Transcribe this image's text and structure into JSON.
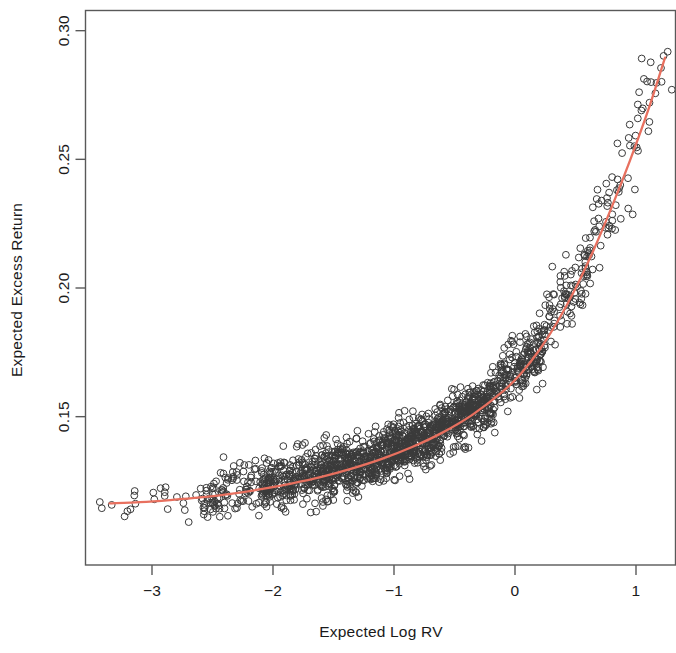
{
  "chart_data": {
    "type": "scatter",
    "title": "",
    "xlabel": "Expected Log RV",
    "ylabel": "Expected Excess Return",
    "xlim": [
      -3.45,
      1.35
    ],
    "ylim": [
      0.1045,
      0.3125
    ],
    "xticks": [
      -3,
      -2,
      -1,
      0,
      1
    ],
    "xtick_labels": [
      "-3",
      "-2",
      "-1",
      "0",
      "1"
    ],
    "yticks": [
      0.15,
      0.2,
      0.25,
      0.3
    ],
    "ytick_labels": [
      "0.15",
      "0.20",
      "0.25",
      "0.30"
    ],
    "grid": false,
    "legend": null,
    "marker": {
      "shape": "open-circle",
      "radius": 3.4,
      "stroke": "#3a3a3a",
      "stroke_width": 1.0,
      "fill": "none"
    },
    "series": [
      {
        "name": "observations",
        "type": "scatter",
        "n_points": 1800,
        "description": "Dense cloud of open circles rising convexly from lower-left to upper-right; heavy concentration between x = -2.4 and x = 0.1 around y = 0.12 to 0.16, thinning and climbing steeply beyond x = 0.2 up to y = 0.30.",
        "density_bands": [
          {
            "x_from": -3.45,
            "x_to": -2.6,
            "y_center": 0.1185,
            "y_spread": 0.0075,
            "weight": 0.012
          },
          {
            "x_from": -2.6,
            "x_to": -2.1,
            "y_center": 0.123,
            "y_spread": 0.0085,
            "weight": 0.055
          },
          {
            "x_from": -2.1,
            "x_to": -1.6,
            "y_center": 0.1285,
            "y_spread": 0.0085,
            "weight": 0.135
          },
          {
            "x_from": -1.6,
            "x_to": -1.1,
            "y_center": 0.1345,
            "y_spread": 0.0085,
            "weight": 0.205
          },
          {
            "x_from": -1.1,
            "x_to": -0.6,
            "y_center": 0.1425,
            "y_spread": 0.0085,
            "weight": 0.225
          },
          {
            "x_from": -0.6,
            "x_to": -0.15,
            "y_center": 0.1545,
            "y_spread": 0.0082,
            "weight": 0.175
          },
          {
            "x_from": -0.15,
            "x_to": 0.25,
            "y_center": 0.176,
            "y_spread": 0.009,
            "weight": 0.105
          },
          {
            "x_from": 0.25,
            "x_to": 0.65,
            "y_center": 0.209,
            "y_spread": 0.012,
            "weight": 0.053
          },
          {
            "x_from": 0.65,
            "x_to": 1.0,
            "y_center": 0.246,
            "y_spread": 0.014,
            "weight": 0.025
          },
          {
            "x_from": 1.0,
            "x_to": 1.3,
            "y_center": 0.281,
            "y_spread": 0.0135,
            "weight": 0.012
          }
        ],
        "x_min": -3.3,
        "x_max": 1.25,
        "y_min": 0.11,
        "y_max": 0.3035
      },
      {
        "name": "fitted-curve",
        "type": "line",
        "color": "#E8705F",
        "line_width": 2.3,
        "description": "Smooth monotonically increasing convex fit, nearly flat at the left and steepening sharply to the right.",
        "points": [
          {
            "x": -3.35,
            "y": 0.1163
          },
          {
            "x": -3.1,
            "y": 0.1168
          },
          {
            "x": -2.85,
            "y": 0.1176
          },
          {
            "x": -2.6,
            "y": 0.1186
          },
          {
            "x": -2.35,
            "y": 0.12
          },
          {
            "x": -2.1,
            "y": 0.1218
          },
          {
            "x": -1.85,
            "y": 0.124
          },
          {
            "x": -1.6,
            "y": 0.1266
          },
          {
            "x": -1.35,
            "y": 0.1298
          },
          {
            "x": -1.1,
            "y": 0.1336
          },
          {
            "x": -0.85,
            "y": 0.1382
          },
          {
            "x": -0.6,
            "y": 0.1438
          },
          {
            "x": -0.35,
            "y": 0.1508
          },
          {
            "x": -0.1,
            "y": 0.1598
          },
          {
            "x": 0.05,
            "y": 0.1668
          },
          {
            "x": 0.2,
            "y": 0.1758
          },
          {
            "x": 0.35,
            "y": 0.1868
          },
          {
            "x": 0.5,
            "y": 0.1998
          },
          {
            "x": 0.65,
            "y": 0.2148
          },
          {
            "x": 0.8,
            "y": 0.2315
          },
          {
            "x": 0.95,
            "y": 0.2495
          },
          {
            "x": 1.1,
            "y": 0.269
          },
          {
            "x": 1.24,
            "y": 0.2895
          }
        ]
      }
    ]
  },
  "colors": {
    "curve": "#E8705F",
    "marker_stroke": "#3a3a3a",
    "axis": "#595959",
    "text": "#1a1a1a",
    "background": "#ffffff"
  }
}
